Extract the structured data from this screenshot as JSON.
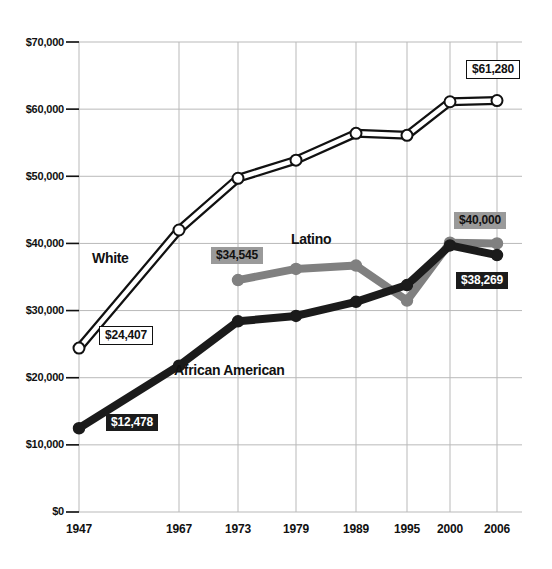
{
  "chart_data": {
    "type": "line",
    "title": "",
    "xlabel": "",
    "ylabel": "",
    "x": [
      "1947",
      "1967",
      "1973",
      "1979",
      "1989",
      "1995",
      "2000",
      "2006"
    ],
    "ylim": [
      0,
      70000
    ],
    "ytick_labels": [
      "$0",
      "$10,000",
      "$20,000",
      "$30,000",
      "$40,000",
      "$50,000",
      "$60,000",
      "$70,000"
    ],
    "ytick_values": [
      0,
      10000,
      20000,
      30000,
      40000,
      50000,
      60000,
      70000
    ],
    "grid": true,
    "legend": "inline-series-labels",
    "series": [
      {
        "name": "White",
        "color": "#ffffff",
        "line_color": "#111111",
        "x": [
          "1947",
          "1967",
          "1973",
          "1979",
          "1989",
          "1995",
          "2000",
          "2006"
        ],
        "values": [
          24407,
          42000,
          49700,
          52400,
          56400,
          56100,
          61100,
          61280
        ]
      },
      {
        "name": "Latino",
        "color": "#808080",
        "line_color": "#808080",
        "x": [
          "1973",
          "1979",
          "1989",
          "1995",
          "2000",
          "2006"
        ],
        "values": [
          34545,
          36200,
          36700,
          31500,
          40100,
          40000
        ]
      },
      {
        "name": "African American",
        "color": "#1b1b1b",
        "line_color": "#1b1b1b",
        "x": [
          "1947",
          "1967",
          "1973",
          "1979",
          "1989",
          "1995",
          "2000",
          "2006"
        ],
        "values": [
          12478,
          21800,
          28400,
          29200,
          31300,
          33800,
          39700,
          38269
        ]
      }
    ],
    "annotations": [
      {
        "id": "white-start",
        "text": "$24,407",
        "style": "boxed",
        "series": "White",
        "x": "1947"
      },
      {
        "id": "white-end",
        "text": "$61,280",
        "style": "boxed",
        "series": "White",
        "x": "2006"
      },
      {
        "id": "latino-start",
        "text": "$34,545",
        "style": "gray",
        "series": "Latino",
        "x": "1973"
      },
      {
        "id": "latino-end",
        "text": "$40,000",
        "style": "gray",
        "series": "Latino",
        "x": "2006"
      },
      {
        "id": "black-start",
        "text": "$12,478",
        "style": "dark",
        "series": "African American",
        "x": "1947"
      },
      {
        "id": "black-end",
        "text": "$38,269",
        "style": "dark",
        "series": "African American",
        "x": "2006"
      }
    ]
  },
  "axis": {
    "yticks": [
      {
        "label": "$70,000"
      },
      {
        "label": "$60,000"
      },
      {
        "label": "$50,000"
      },
      {
        "label": "$40,000"
      },
      {
        "label": "$30,000"
      },
      {
        "label": "$20,000"
      },
      {
        "label": "$10,000"
      },
      {
        "label": "$0"
      }
    ],
    "xticks": [
      {
        "label": "1947"
      },
      {
        "label": "1967"
      },
      {
        "label": "1973"
      },
      {
        "label": "1979"
      },
      {
        "label": "1989"
      },
      {
        "label": "1995"
      },
      {
        "label": "2000"
      },
      {
        "label": "2006"
      }
    ]
  },
  "series_labels": {
    "white": "White",
    "latino": "Latino",
    "african_american": "African American"
  },
  "value_labels": {
    "white_start": "$24,407",
    "white_end": "$61,280",
    "latino_start": "$34,545",
    "latino_end": "$40,000",
    "black_start": "$12,478",
    "black_end": "$38,269"
  },
  "colors": {
    "grid": "#b9b9b9",
    "white_series": "#ffffff",
    "white_series_outline": "#111111",
    "latino_series": "#808080",
    "african_american_series": "#1b1b1b",
    "text": "#111111"
  }
}
